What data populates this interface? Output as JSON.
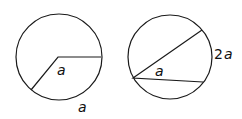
{
  "figure_left": {
    "center_label": "a",
    "arc_label": "a"
  },
  "figure_right": {
    "chord_label": "a",
    "arc_label_coef": "2",
    "arc_label_var": "a"
  },
  "colors": {
    "stroke": "#1a1a1a",
    "background": "#ffffff"
  }
}
